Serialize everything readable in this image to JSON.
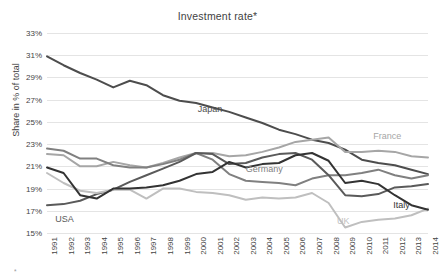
{
  "chart_data": {
    "type": "line",
    "title": "Investment rate*",
    "xlabel": "",
    "ylabel": "Share in % of total",
    "x": [
      1991,
      1992,
      1993,
      1994,
      1995,
      1996,
      1997,
      1998,
      1999,
      2000,
      2001,
      2002,
      2003,
      2004,
      2005,
      2006,
      2007,
      2008,
      2009,
      2010,
      2011,
      2012,
      2013,
      2014
    ],
    "ylim": [
      15,
      33
    ],
    "yticks": [
      "15%",
      "17%",
      "19%",
      "21%",
      "23%",
      "25%",
      "27%",
      "29%",
      "31%",
      "33%"
    ],
    "ytick_values": [
      15,
      17,
      19,
      21,
      23,
      25,
      27,
      29,
      31,
      33
    ],
    "xtick_labels": [
      "1991",
      "1992",
      "1993",
      "1994",
      "1995",
      "1996",
      "1997",
      "1998",
      "1999",
      "2000",
      "2001",
      "2002",
      "2003",
      "2004",
      "2005",
      "2006",
      "2007",
      "2008",
      "2009",
      "2010",
      "2011",
      "2012",
      "2013",
      "2014"
    ],
    "grid": true,
    "legend": "inline-labels",
    "series": [
      {
        "name": "Japan",
        "color": "#4d4d4d",
        "width": 2.0,
        "label_x": 2000.1,
        "label_y": 26.55,
        "values": [
          30.9,
          30.1,
          29.4,
          28.8,
          28.1,
          28.7,
          28.3,
          27.4,
          26.9,
          26.7,
          26.3,
          25.9,
          25.4,
          24.9,
          24.3,
          23.9,
          23.4,
          23.1,
          22.5,
          21.6,
          21.3,
          21.1,
          20.7,
          20.3
        ]
      },
      {
        "name": "France",
        "color": "#a6a6a6",
        "width": 2.0,
        "label_x": 2010.7,
        "label_y": 24.1,
        "values": [
          22.1,
          22.0,
          21.0,
          21.0,
          21.4,
          21.1,
          20.9,
          21.3,
          21.8,
          22.2,
          22.2,
          21.9,
          22.0,
          22.3,
          22.7,
          23.2,
          23.4,
          23.6,
          22.3,
          22.3,
          22.4,
          22.3,
          21.9,
          21.8
        ]
      },
      {
        "name": "Germany",
        "color": "#808080",
        "width": 2.0,
        "label_x": 2003.0,
        "label_y": 21.1,
        "values": [
          22.6,
          22.4,
          21.7,
          21.7,
          21.1,
          20.9,
          20.9,
          21.2,
          21.6,
          22.2,
          21.6,
          20.3,
          19.7,
          19.6,
          19.5,
          19.3,
          19.9,
          20.2,
          20.2,
          20.4,
          20.7,
          20.2,
          19.9,
          20.2
        ]
      },
      {
        "name": "USA",
        "color": "#5a5a5a",
        "width": 2.0,
        "label_x": 1991.5,
        "label_y": 16.6,
        "values": [
          17.5,
          17.6,
          17.9,
          18.5,
          18.9,
          19.6,
          20.2,
          20.8,
          21.4,
          22.2,
          22.1,
          21.2,
          21.3,
          21.8,
          22.1,
          22.2,
          21.6,
          20.2,
          18.4,
          18.3,
          18.5,
          19.1,
          19.2,
          19.4
        ]
      },
      {
        "name": "UK",
        "color": "#bfbfbf",
        "width": 2.0,
        "label_x": 2008.5,
        "label_y": 16.4,
        "values": [
          20.4,
          19.5,
          18.8,
          18.6,
          18.9,
          18.9,
          18.1,
          19.0,
          19.0,
          18.7,
          18.6,
          18.4,
          18.0,
          18.2,
          18.1,
          18.2,
          18.6,
          17.7,
          15.5,
          16.0,
          16.2,
          16.3,
          16.6,
          17.2
        ]
      },
      {
        "name": "Italy",
        "color": "#333333",
        "width": 2.0,
        "label_x": 2011.9,
        "label_y": 17.9,
        "values": [
          20.9,
          20.4,
          18.4,
          18.1,
          19.0,
          19.0,
          19.1,
          19.3,
          19.7,
          20.3,
          20.5,
          21.4,
          20.9,
          21.2,
          21.3,
          22.0,
          22.2,
          21.5,
          19.5,
          19.7,
          19.4,
          18.4,
          17.5,
          17.1
        ]
      }
    ],
    "footnote": "*"
  }
}
